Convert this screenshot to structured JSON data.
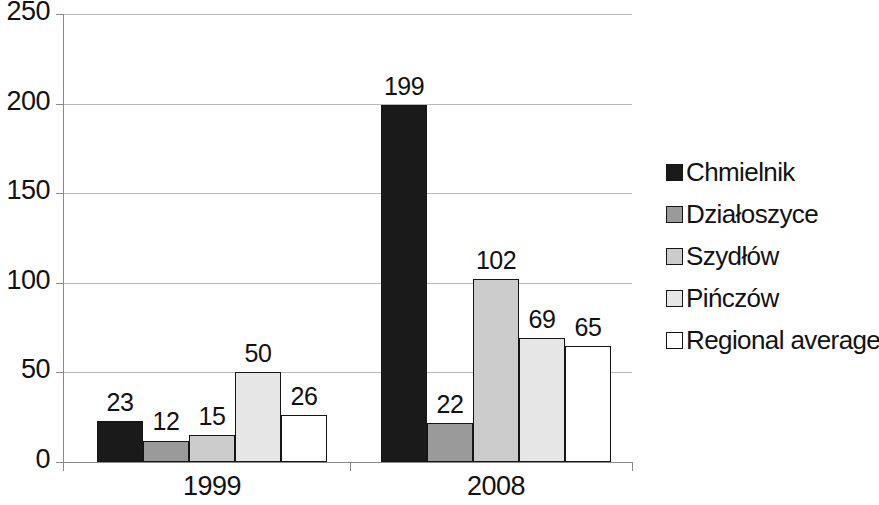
{
  "chart_data": {
    "type": "bar",
    "title": "",
    "xlabel": "",
    "ylabel": "",
    "categories": [
      "1999",
      "2008"
    ],
    "ylim": [
      0,
      250
    ],
    "yticks": [
      0,
      50,
      100,
      150,
      200,
      250
    ],
    "ytick_labels": [
      "0",
      "50",
      "100",
      "150",
      "200",
      "250"
    ],
    "grid": true,
    "legend_position": "right",
    "series": [
      {
        "name": "Chmielnik",
        "color": "#1a1a1a",
        "values": [
          23,
          199
        ]
      },
      {
        "name": "Działoszyce",
        "color": "#9a9a9a",
        "values": [
          12,
          22
        ]
      },
      {
        "name": "Szydłów",
        "color": "#cccccc",
        "values": [
          15,
          102
        ]
      },
      {
        "name": "Pińczów",
        "color": "#e6e6e6",
        "values": [
          50,
          69
        ]
      },
      {
        "name": "Regional average",
        "color": "#ffffff",
        "values": [
          26,
          65
        ]
      }
    ],
    "data_labels": {
      "1999": [
        "23",
        "12",
        "15",
        "50",
        "26"
      ],
      "2008": [
        "199",
        "22",
        "102",
        "69",
        "65"
      ]
    }
  },
  "axis": {
    "tick_0": "0",
    "tick_50": "50",
    "tick_100": "100",
    "tick_150": "150",
    "tick_200": "200",
    "tick_250": "250"
  },
  "groups": [
    {
      "label": "1999"
    },
    {
      "label": "2008"
    }
  ],
  "legend": {
    "items": [
      {
        "label": "Chmielnik",
        "color": "#1a1a1a"
      },
      {
        "label": "Działoszyce",
        "color": "#9a9a9a"
      },
      {
        "label": "Szydłów",
        "color": "#cccccc"
      },
      {
        "label": "Pińczów",
        "color": "#e6e6e6"
      },
      {
        "label": "Regional average",
        "color": "#ffffff"
      }
    ]
  }
}
